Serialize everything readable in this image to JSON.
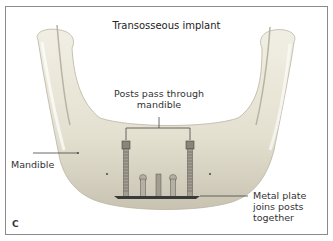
{
  "figure": {
    "title": "Transosseous implant",
    "panel_letter": "C",
    "labels": {
      "posts": [
        "Posts pass through",
        "mandible"
      ],
      "mandible": "Mandible",
      "plate": [
        "Metal plate",
        "joins posts",
        "together"
      ]
    },
    "colors": {
      "border": "#8a8a8a",
      "bone_light": "#ece9dc",
      "bone_shade": "#c9c4b3",
      "leader_line": "#444444",
      "text": "#333333"
    }
  }
}
